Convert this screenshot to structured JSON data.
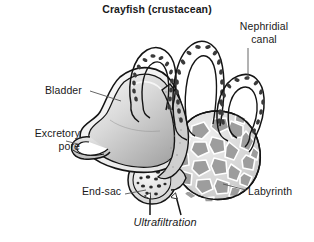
{
  "figure": {
    "title": "Crayfish (crustacean)",
    "background_color": "#ffffff",
    "line_color": "#141414",
    "labels": [
      {
        "id": "nephridial_canal",
        "text": "Nephridial\ncanal",
        "points_to": "coiled nephridial tubule loops at top right"
      },
      {
        "id": "bladder",
        "text": "Bladder",
        "points_to": "large grey sac at left"
      },
      {
        "id": "excretory_pore",
        "text": "Excretory\npore",
        "points_to": "small spout at lower-left of bladder"
      },
      {
        "id": "end_sac",
        "text": "End-sac",
        "points_to": "small round dotted sac at lower centre"
      },
      {
        "id": "labyrinth",
        "text": "Labyrinth",
        "points_to": "polygonal cell mass at lower right"
      },
      {
        "id": "ultrafiltration",
        "text": "Ultrafiltration",
        "style": "italic",
        "points_to": "upward arrows entering end-sac and labyrinth"
      }
    ],
    "colors": {
      "bladder_fill_light": "#eeeeee",
      "bladder_fill_mid": "#c9c9c9",
      "bladder_fill_dark": "#a8a8a8",
      "tubule_fill": "#ffffff",
      "tubule_cell_fill": "#3a3a3a",
      "labyrinth_cell_fill": "#9d9d9d",
      "labyrinth_wall": "#ffffff",
      "stipple": "#b5b5b5",
      "leader_line": "#555555",
      "text": "#1a1a1a"
    }
  }
}
